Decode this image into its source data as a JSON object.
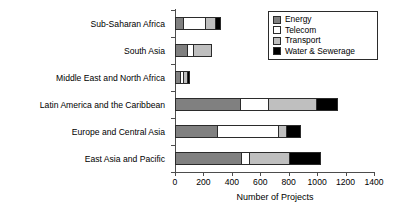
{
  "chart_data": {
    "type": "bar",
    "orientation": "horizontal",
    "stacked": true,
    "title": "",
    "xlabel": "Number of Projects",
    "ylabel": "",
    "xlim": [
      0,
      1400
    ],
    "xticks": [
      0,
      200,
      400,
      600,
      800,
      1000,
      1200,
      1400
    ],
    "grid": false,
    "legend_position": "top-right",
    "categories": [
      "Sub-Saharan Africa",
      "South Asia",
      "Middle East and North Africa",
      "Latin America and the Caribbean",
      "Europe and Central Asia",
      "East Asia and Pacific"
    ],
    "series": [
      {
        "name": "Energy",
        "color": "#808080",
        "values": [
          50,
          80,
          25,
          450,
          290,
          460
        ]
      },
      {
        "name": "Telecom",
        "color": "#ffffff",
        "values": [
          150,
          35,
          20,
          190,
          420,
          50
        ]
      },
      {
        "name": "Transport",
        "color": "#bfbfbf",
        "values": [
          60,
          120,
          15,
          330,
          50,
          270
        ]
      },
      {
        "name": "Water & Sewerage",
        "color": "#000000",
        "values": [
          30,
          0,
          10,
          145,
          90,
          215
        ]
      }
    ],
    "totals": [
      290,
      235,
      70,
      1115,
      850,
      995
    ]
  },
  "legend": {
    "items": [
      {
        "label": "Energy"
      },
      {
        "label": "Telecom"
      },
      {
        "label": "Transport"
      },
      {
        "label": "Water & Sewerage"
      }
    ]
  }
}
